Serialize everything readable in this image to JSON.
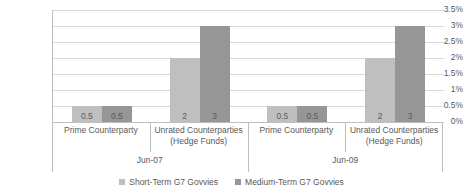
{
  "chart_data": {
    "type": "bar",
    "title": "",
    "xlabel": "",
    "ylabel": "",
    "ylim": [
      0,
      3.5
    ],
    "ytick_labels": [
      "3.5%",
      "3%",
      "2.5%",
      "2%",
      "1.5%",
      "1%",
      "0.5%",
      "0%"
    ],
    "ytick_values": [
      3.5,
      3,
      2.5,
      2,
      1.5,
      1,
      0.5,
      0
    ],
    "grid": true,
    "legend_position": "bottom",
    "groups": [
      "Jun-07",
      "Jun-09"
    ],
    "categories": [
      "Prime Counterparty",
      "Unrated Counterparties (Hedge Funds)",
      "Prime Counterparty",
      "Unrated Counterparties (Hedge Funds)"
    ],
    "category_lines": [
      [
        "Prime Counterparty",
        ""
      ],
      [
        "Unrated Counterparties",
        "(Hedge Funds)"
      ],
      [
        "Prime Counterparty",
        ""
      ],
      [
        "Unrated Counterparties",
        "(Hedge Funds)"
      ]
    ],
    "series": [
      {
        "name": "Short-Term G7 Govvies",
        "color": "#bfbfbf",
        "values": [
          0.5,
          2,
          0.5,
          2
        ],
        "labels": [
          "0.5",
          "2",
          "0.5",
          "2"
        ]
      },
      {
        "name": "Medium-Term G7 Govvies",
        "color": "#969696",
        "values": [
          0.5,
          3,
          0.5,
          3
        ],
        "labels": [
          "0.5",
          "3",
          "0.5",
          "3"
        ]
      }
    ]
  },
  "legend": {
    "items": [
      {
        "label": "Short-Term G7 Govvies",
        "color": "#bfbfbf"
      },
      {
        "label": "Medium-Term G7 Govvies",
        "color": "#969696"
      }
    ]
  },
  "axis": {
    "group_labels": [
      "Jun-07",
      "Jun-09"
    ]
  },
  "colors": {
    "short_term": "#bfbfbf",
    "medium_term": "#969696",
    "gridline": "#d9d9d9",
    "axis": "#bfbfbf",
    "text": "#595959"
  }
}
